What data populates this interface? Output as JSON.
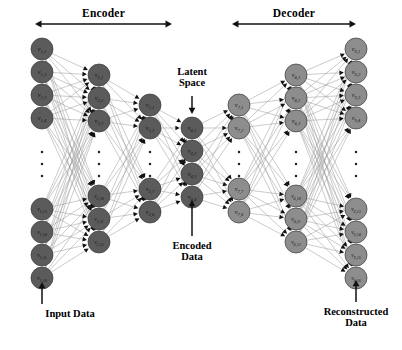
{
  "figure": {
    "type": "neural-network-architecture",
    "sections": [
      {
        "id": "encoder",
        "label": "Encoder",
        "x1": 35,
        "x2": 172,
        "y": 24
      },
      {
        "id": "decoder",
        "label": "Decoder",
        "x1": 232,
        "x2": 356,
        "y": 24
      }
    ],
    "annotations": [
      {
        "id": "latent-space",
        "label": "Latent\nSpace",
        "line1": "Latent",
        "line2": "Space",
        "x": 192,
        "y": 66,
        "arrow": "down",
        "arrow_x": 192,
        "arrow_y1": 96,
        "arrow_y2": 114
      },
      {
        "id": "encoded-data",
        "label": "Encoded\nData",
        "line1": "Encoded",
        "line2": "Data",
        "x": 192,
        "y": 240,
        "arrow": "up",
        "arrow_x": 192,
        "arrow_y1": 236,
        "arrow_y2": 200
      }
    ],
    "io_labels": [
      {
        "id": "input-data",
        "line1": "Input Data",
        "line2": "",
        "x": 42,
        "y": 308,
        "arrow_x": 42,
        "arrow_y1": 304,
        "arrow_y2": 282
      },
      {
        "id": "reconstructed-data",
        "line1": "Reconstructed",
        "line2": "Data",
        "x": 356,
        "y": 306,
        "arrow_x": 356,
        "arrow_y1": 302,
        "arrow_y2": 280
      }
    ],
    "colors": {
      "encoder_node_fill": "#5b5b5b",
      "decoder_node_fill": "#8d8d8d",
      "node_stroke": "#3a3a3a",
      "edge": "#9a9a9a",
      "arrowhead": "#111111",
      "text": "#000000",
      "node_label": "#15151a",
      "background": "#ffffff"
    },
    "layers": [
      {
        "id": "layer-1",
        "role": "input",
        "group": "encoder",
        "x": 42,
        "r": 11,
        "has_ellipsis": true,
        "ellipsis_y": [
          152,
          164,
          176
        ],
        "top_nodes": [
          {
            "label": "v1,1",
            "sub": "1,1",
            "y": 49
          },
          {
            "label": "v1,2",
            "sub": "1,2",
            "y": 72
          },
          {
            "label": "v1,3",
            "sub": "1,3",
            "y": 95
          },
          {
            "label": "v1,4",
            "sub": "1,4",
            "y": 118
          }
        ],
        "bottom_nodes": [
          {
            "label": "v1,13",
            "sub": "1,13",
            "y": 209
          },
          {
            "label": "v1,14",
            "sub": "1,14",
            "y": 232
          },
          {
            "label": "v1,15",
            "sub": "1,15",
            "y": 255
          },
          {
            "label": "v1,16",
            "sub": "1,16",
            "y": 278
          }
        ]
      },
      {
        "id": "layer-2",
        "role": "hidden",
        "group": "encoder",
        "x": 99,
        "r": 11,
        "has_ellipsis": true,
        "ellipsis_y": [
          152,
          164,
          176
        ],
        "top_nodes": [
          {
            "label": "v2,1",
            "sub": "2,1",
            "y": 75
          },
          {
            "label": "v2,2",
            "sub": "2,2",
            "y": 98
          },
          {
            "label": "v2,3",
            "sub": "2,3",
            "y": 121
          }
        ],
        "bottom_nodes": [
          {
            "label": "v2,10",
            "sub": "2,10",
            "y": 196
          },
          {
            "label": "v2,11",
            "sub": "2,11",
            "y": 219
          },
          {
            "label": "v2,12",
            "sub": "2,12",
            "y": 242
          }
        ]
      },
      {
        "id": "layer-3",
        "role": "hidden",
        "group": "encoder",
        "x": 150,
        "r": 11,
        "has_ellipsis": true,
        "ellipsis_y": [
          152,
          164,
          176
        ],
        "top_nodes": [
          {
            "label": "v3,1",
            "sub": "3,1",
            "y": 105
          },
          {
            "label": "v3,2",
            "sub": "3,2",
            "y": 128
          }
        ],
        "bottom_nodes": [
          {
            "label": "v3,7",
            "sub": "3,7",
            "y": 189
          },
          {
            "label": "v3,8",
            "sub": "3,8",
            "y": 212
          }
        ]
      },
      {
        "id": "layer-latent",
        "role": "latent",
        "group": "encoder",
        "x": 192,
        "r": 11,
        "has_ellipsis": false,
        "ellipsis_y": [],
        "top_nodes": [
          {
            "label": "v4,1",
            "sub": "4,1",
            "y": 128
          },
          {
            "label": "v4,2",
            "sub": "4,2",
            "y": 151
          },
          {
            "label": "v4,3",
            "sub": "4,3",
            "y": 174
          },
          {
            "label": "v4,4",
            "sub": "4,4",
            "y": 197
          }
        ],
        "bottom_nodes": []
      },
      {
        "id": "layer-7",
        "role": "hidden",
        "group": "decoder",
        "x": 239,
        "r": 11,
        "has_ellipsis": true,
        "ellipsis_y": [
          152,
          164,
          176
        ],
        "top_nodes": [
          {
            "label": "v7,1",
            "sub": "7,1",
            "y": 105
          },
          {
            "label": "v7,2",
            "sub": "7,2",
            "y": 128
          }
        ],
        "bottom_nodes": [
          {
            "label": "v7,7",
            "sub": "7,7",
            "y": 189
          },
          {
            "label": "v7,8",
            "sub": "7,8",
            "y": 212
          }
        ]
      },
      {
        "id": "layer-8",
        "role": "hidden",
        "group": "decoder",
        "x": 296,
        "r": 11,
        "has_ellipsis": true,
        "ellipsis_y": [
          152,
          164,
          176
        ],
        "top_nodes": [
          {
            "label": "v8,1",
            "sub": "8,1",
            "y": 75
          },
          {
            "label": "v8,2",
            "sub": "8,2",
            "y": 98
          },
          {
            "label": "v8,3",
            "sub": "8,3",
            "y": 121
          }
        ],
        "bottom_nodes": [
          {
            "label": "v8,10",
            "sub": "8,10",
            "y": 196
          },
          {
            "label": "v8,11",
            "sub": "8,11",
            "y": 219
          },
          {
            "label": "v8,12",
            "sub": "8,12",
            "y": 242
          }
        ]
      },
      {
        "id": "layer-9",
        "role": "output",
        "group": "decoder",
        "x": 356,
        "r": 11,
        "has_ellipsis": true,
        "ellipsis_y": [
          152,
          164,
          176
        ],
        "top_nodes": [
          {
            "label": "v9,1",
            "sub": "9,1",
            "y": 49
          },
          {
            "label": "v9,2",
            "sub": "9,2",
            "y": 72
          },
          {
            "label": "v9,3",
            "sub": "9,3",
            "y": 95
          },
          {
            "label": "v9,4",
            "sub": "9,4",
            "y": 118
          }
        ],
        "bottom_nodes": [
          {
            "label": "v9,13",
            "sub": "9,13",
            "y": 209
          },
          {
            "label": "v9,14",
            "sub": "9,14",
            "y": 232
          },
          {
            "label": "v9,15",
            "sub": "9,15",
            "y": 255
          },
          {
            "label": "v9,16",
            "sub": "9,16",
            "y": 278
          }
        ]
      }
    ]
  }
}
